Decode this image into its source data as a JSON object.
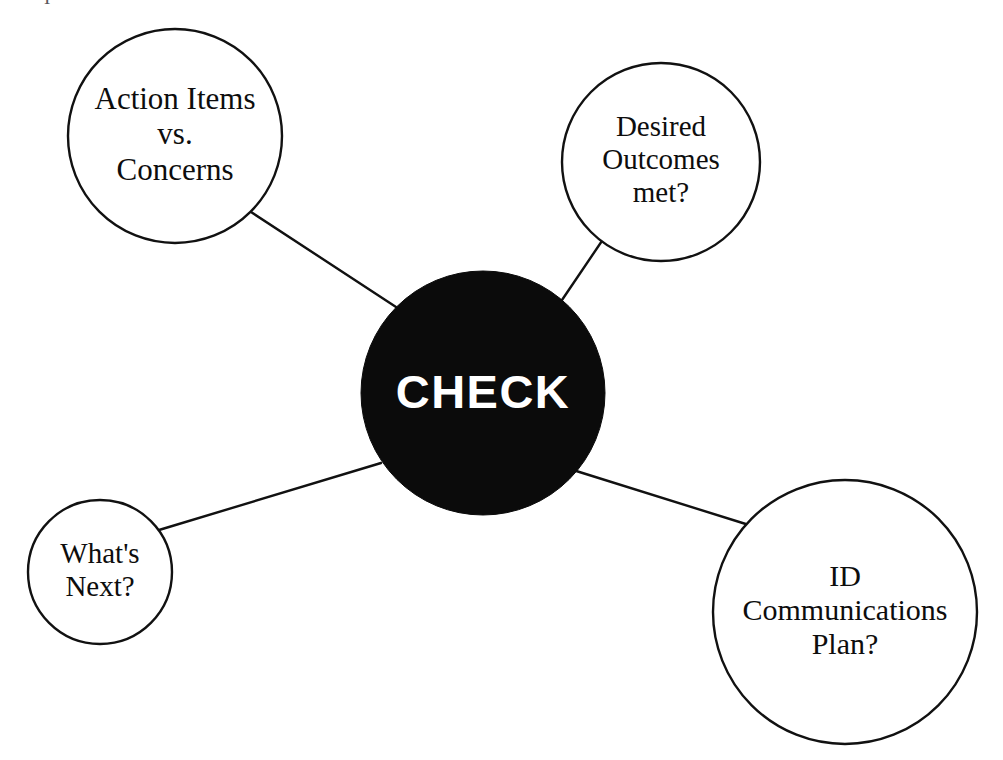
{
  "canvas": {
    "width": 1003,
    "height": 760,
    "background": "#ffffff",
    "stroke_color": "#111111",
    "stroke_width": 2.2
  },
  "hub": {
    "label": "CHECK",
    "fill": "#0b0b0b",
    "text_color": "#ffffff",
    "cx": 483,
    "cy": 393,
    "r": 122,
    "font_size": 47
  },
  "nodes": [
    {
      "id": "action-items-vs-concerns",
      "name": "action-items-vs-concerns",
      "lines": [
        "Action Items",
        "vs.",
        "Concerns"
      ],
      "cx": 175,
      "cy": 136,
      "r": 107,
      "font_size": 31,
      "fill": "#ffffff",
      "text_color": "#0d0d0d"
    },
    {
      "id": "desired-outcomes-met",
      "name": "desired-outcomes-met",
      "lines": [
        "Desired",
        "Outcomes",
        "met?"
      ],
      "cx": 661,
      "cy": 162,
      "r": 99,
      "font_size": 29,
      "fill": "#ffffff",
      "text_color": "#0d0d0d"
    },
    {
      "id": "whats-next",
      "name": "whats-next",
      "lines": [
        "What's",
        "Next?"
      ],
      "cx": 100,
      "cy": 572,
      "r": 72,
      "font_size": 29,
      "fill": "#ffffff",
      "text_color": "#0d0d0d"
    },
    {
      "id": "id-communications-plan",
      "name": "id-communications-plan",
      "lines": [
        "ID",
        "Communications",
        "Plan?"
      ],
      "cx": 845,
      "cy": 612,
      "r": 132,
      "font_size": 30,
      "fill": "#ffffff",
      "text_color": "#0d0d0d"
    }
  ],
  "connectors": [
    {
      "id": "connector-top-left",
      "from": "action-items-vs-concerns",
      "to": "hub",
      "x1": 251,
      "y1": 212,
      "x2": 396,
      "y2": 307
    },
    {
      "id": "connector-top-right",
      "from": "desired-outcomes-met",
      "to": "hub",
      "x1": 608,
      "y1": 232,
      "x2": 562,
      "y2": 300
    },
    {
      "id": "connector-bottom-left",
      "from": "whats-next",
      "to": "hub",
      "x1": 159,
      "y1": 530,
      "x2": 381,
      "y2": 463
    },
    {
      "id": "connector-bottom-right",
      "from": "id-communications-plan",
      "to": "hub",
      "x1": 749,
      "y1": 525,
      "x2": 573,
      "y2": 470
    }
  ],
  "artifact": {
    "glyph": "I"
  }
}
